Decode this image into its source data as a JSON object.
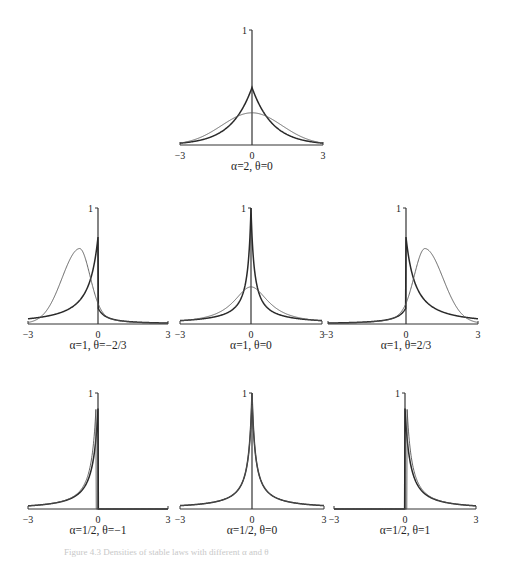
{
  "figure": {
    "caption": "Figure 4.3 Densities of stable laws with different α and θ"
  },
  "chart_data": [
    {
      "type": "line",
      "title": "α=2, θ=0",
      "xlabel": "",
      "ylabel": "",
      "xlim": [
        -3,
        3
      ],
      "ylim": [
        0,
        1
      ],
      "x_ticks": [
        "−3",
        "0",
        "3"
      ],
      "y_ticks": [
        "1"
      ],
      "grid": false,
      "series": [
        {
          "name": "stable density (thick)",
          "shape": "laplace-like cusp",
          "peak_x": 0,
          "peak_y": 0.5
        },
        {
          "name": "comparison density (thin)",
          "shape": "bell",
          "peak_x": 0,
          "peak_y": 0.28
        }
      ],
      "layout": {
        "x0": 180,
        "x1": 323,
        "zero_x": 252,
        "base_y": 145,
        "top_y": 30,
        "label_y": 170
      }
    },
    {
      "type": "line",
      "title": "α=1, θ=−2/3",
      "xlim": [
        -3,
        3
      ],
      "ylim": [
        0,
        1
      ],
      "x_ticks": [
        "−3",
        "0",
        "3"
      ],
      "y_ticks": [
        "1"
      ],
      "grid": false,
      "series": [
        {
          "name": "stable density (thick)",
          "shape": "one-sided left, spike at 0",
          "peak_x": 0,
          "peak_y": 0.75
        },
        {
          "name": "comparison density (thin)",
          "shape": "skewed bell",
          "peak_x": -0.8,
          "peak_y": 0.62
        }
      ],
      "layout": {
        "x0": 28,
        "x1": 168,
        "zero_x": 98,
        "base_y": 324,
        "top_y": 208,
        "label_y": 349
      }
    },
    {
      "type": "line",
      "title": "α=1, θ=0",
      "xlim": [
        -3,
        3
      ],
      "ylim": [
        0,
        1
      ],
      "x_ticks": [
        "−3",
        "0",
        "3"
      ],
      "y_ticks": [
        "1"
      ],
      "grid": false,
      "series": [
        {
          "name": "stable density (thick)",
          "shape": "sharp cusp",
          "peak_x": 0,
          "peak_y": 1.0
        },
        {
          "name": "comparison density (thin)",
          "shape": "cauchy bell",
          "peak_x": 0,
          "peak_y": 0.32
        }
      ],
      "layout": {
        "x0": 180,
        "x1": 322,
        "zero_x": 251,
        "base_y": 324,
        "top_y": 208,
        "label_y": 349
      }
    },
    {
      "type": "line",
      "title": "α=1, θ=2/3",
      "xlim": [
        -3,
        3
      ],
      "ylim": [
        0,
        1
      ],
      "x_ticks": [
        "−3",
        "0",
        "3"
      ],
      "y_ticks": [
        "1"
      ],
      "grid": false,
      "series": [
        {
          "name": "stable density (thick)",
          "shape": "one-sided right, spike at 0",
          "peak_x": 0,
          "peak_y": 0.75
        },
        {
          "name": "comparison density (thin)",
          "shape": "skewed bell",
          "peak_x": 0.8,
          "peak_y": 0.62
        }
      ],
      "layout": {
        "x0": 328,
        "x1": 478,
        "zero_x": 406,
        "base_y": 324,
        "top_y": 208,
        "label_y": 349
      }
    },
    {
      "type": "line",
      "title": "α=1/2, θ=−1",
      "xlim": [
        -3,
        3
      ],
      "ylim": [
        0,
        1
      ],
      "x_ticks": [
        "−3",
        "0",
        "3"
      ],
      "y_ticks": [
        "1"
      ],
      "grid": false,
      "series": [
        {
          "name": "stable density (thick)",
          "shape": "one-sided left heavy tail",
          "peak_x": 0,
          "peak_y": 0.95
        },
        {
          "name": "comparison density (thin)",
          "shape": "one-sided left heavy tail",
          "peak_x": -0.1,
          "peak_y": 0.9
        }
      ],
      "layout": {
        "x0": 28,
        "x1": 168,
        "zero_x": 98,
        "base_y": 509,
        "top_y": 393,
        "label_y": 534
      }
    },
    {
      "type": "line",
      "title": "α=1/2, θ=0",
      "xlim": [
        -3,
        3
      ],
      "ylim": [
        0,
        1
      ],
      "x_ticks": [
        "−3",
        "0",
        "3"
      ],
      "y_ticks": [
        "1"
      ],
      "grid": false,
      "series": [
        {
          "name": "stable density (thick)",
          "shape": "sharp cusp",
          "peak_x": 0,
          "peak_y": 1.0
        },
        {
          "name": "comparison density (thin)",
          "shape": "sharp cusp",
          "peak_x": 0,
          "peak_y": 1.0
        }
      ],
      "layout": {
        "x0": 180,
        "x1": 324,
        "zero_x": 252,
        "base_y": 509,
        "top_y": 393,
        "label_y": 534
      }
    },
    {
      "type": "line",
      "title": "α=1/2, θ=1",
      "xlim": [
        -3,
        3
      ],
      "ylim": [
        0,
        1
      ],
      "x_ticks": [
        "−3",
        "0",
        "3"
      ],
      "y_ticks": [
        "1"
      ],
      "grid": false,
      "series": [
        {
          "name": "stable density (thick)",
          "shape": "one-sided right heavy tail",
          "peak_x": 0,
          "peak_y": 0.95
        },
        {
          "name": "comparison density (thin)",
          "shape": "one-sided right heavy tail",
          "peak_x": 0.1,
          "peak_y": 0.9
        }
      ],
      "layout": {
        "x0": 334,
        "x1": 476,
        "zero_x": 405,
        "base_y": 509,
        "top_y": 393,
        "label_y": 534
      }
    }
  ]
}
